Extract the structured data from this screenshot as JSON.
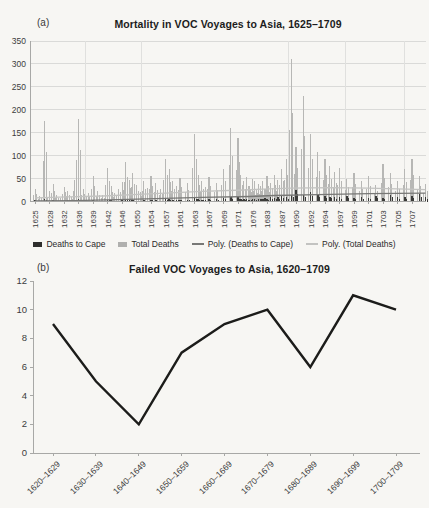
{
  "figure": {
    "bg": "#f7f6f3"
  },
  "chart_data": [
    {
      "type": "bar",
      "panel_label": "(a)",
      "title": "Mortality in VOC Voyages to Asia, 1625–1709",
      "ylabel": "",
      "xlabel": "",
      "ylim": [
        0,
        350
      ],
      "y_ticks": [
        0,
        50,
        100,
        150,
        200,
        250,
        300,
        350
      ],
      "grid": "horizontal",
      "x_tick_labels": [
        "1625",
        "1628",
        "1632",
        "1636",
        "1639",
        "1642",
        "1646",
        "1650",
        "1654",
        "1657",
        "1661",
        "1663",
        "1667",
        "1669",
        "1671",
        "1676",
        "1683",
        "1687",
        "1690",
        "1692",
        "1694",
        "1697",
        "1699",
        "1701",
        "1703",
        "1705",
        "1707"
      ],
      "years": {
        "start": 1625,
        "end": 1709
      },
      "series": [
        {
          "name": "Total Deaths",
          "kind": "bar",
          "color": "#b7b7b5",
          "values": [
            28,
            12,
            175,
            22,
            38,
            14,
            8,
            32,
            24,
            10,
            48,
            180,
            28,
            18,
            56,
            24,
            14,
            74,
            34,
            18,
            28,
            42,
            86,
            46,
            62,
            36,
            20,
            44,
            30,
            56,
            40,
            28,
            92,
            70,
            44,
            34,
            52,
            40,
            148,
            58,
            44,
            32,
            54,
            40,
            72,
            160,
            138,
            58,
            44,
            54,
            34,
            50,
            44,
            28,
            38,
            34,
            44,
            28,
            56,
            40,
            58,
            48,
            72,
            92,
            310,
            118,
            230,
            148,
            108,
            92,
            78,
            64,
            74,
            50,
            62,
            44,
            56,
            36,
            82,
            62,
            44,
            70,
            92,
            56,
            38
          ]
        },
        {
          "name": "Deaths to Cape",
          "kind": "bar",
          "color": "#3a3a38",
          "values": [
            3,
            1,
            5,
            2,
            3,
            1,
            1,
            2,
            3,
            1,
            4,
            6,
            2,
            1,
            3,
            2,
            1,
            4,
            3,
            2,
            2,
            3,
            5,
            4,
            3,
            2,
            1,
            3,
            2,
            4,
            3,
            2,
            6,
            5,
            3,
            4,
            4,
            4,
            8,
            5,
            4,
            3,
            6,
            5,
            7,
            10,
            9,
            6,
            5,
            6,
            4,
            6,
            5,
            4,
            5,
            6,
            5,
            8,
            6,
            9,
            8,
            10,
            12,
            10,
            14,
            25,
            15,
            20,
            14,
            12,
            11,
            10,
            9,
            12,
            8,
            10,
            8,
            12,
            7,
            15,
            10,
            9,
            13,
            16,
            10
          ]
        },
        {
          "name": "Poly. (Deaths to Cape)",
          "kind": "poly-line",
          "color": "#787876",
          "points": [
            [
              1625,
              1
            ],
            [
              1635,
              2
            ],
            [
              1645,
              4
            ],
            [
              1655,
              6
            ],
            [
              1665,
              9
            ],
            [
              1675,
              11
            ],
            [
              1685,
              13
            ],
            [
              1693,
              15
            ],
            [
              1701,
              17
            ],
            [
              1709,
              18
            ]
          ]
        },
        {
          "name": "Poly. (Total Deaths)",
          "kind": "poly-line",
          "color": "#c3c3c1",
          "points": [
            [
              1625,
              8
            ],
            [
              1633,
              10
            ],
            [
              1641,
              12
            ],
            [
              1649,
              15
            ],
            [
              1657,
              18
            ],
            [
              1665,
              22
            ],
            [
              1673,
              25
            ],
            [
              1681,
              27
            ],
            [
              1689,
              29
            ],
            [
              1695,
              30
            ],
            [
              1701,
              29
            ],
            [
              1709,
              26
            ]
          ]
        }
      ],
      "legend": [
        {
          "label": "Deaths to Cape",
          "swatch": "square",
          "color": "#2e2e2c"
        },
        {
          "label": "Total Deaths",
          "swatch": "square",
          "color": "#b0b0ae"
        },
        {
          "label": "Poly. (Deaths to Cape)",
          "swatch": "line",
          "color": "#787876"
        },
        {
          "label": "Poly. (Total Deaths)",
          "swatch": "line",
          "color": "#c3c3c1"
        }
      ]
    },
    {
      "type": "line",
      "panel_label": "(b)",
      "title": "Failed VOC Voyages to Asia, 1620–1709",
      "ylabel": "",
      "xlabel": "",
      "ylim": [
        0,
        12
      ],
      "y_ticks": [
        0,
        2,
        4,
        6,
        8,
        10,
        12
      ],
      "grid": "off",
      "categories": [
        "1620–1629",
        "1630–1639",
        "1640–1649",
        "1650–1659",
        "1660–1669",
        "1670–1679",
        "1680–1689",
        "1690–1699",
        "1700–1709"
      ],
      "values": [
        9,
        5,
        2,
        7,
        9,
        10,
        6,
        11,
        10
      ],
      "line_color": "#1c1c1a"
    }
  ]
}
